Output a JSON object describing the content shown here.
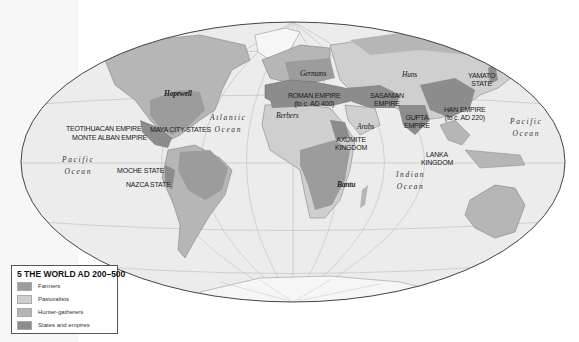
{
  "legend": {
    "title": "5 THE WORLD AD 200–500",
    "items": [
      {
        "label": "Farmers",
        "color": "#9c9c9c"
      },
      {
        "label": "Pastoralists",
        "color": "#cfcfcf"
      },
      {
        "label": "Hunter-gatherers",
        "color": "#b6b6b6"
      },
      {
        "label": "States and empires",
        "color": "#8c8c8c"
      }
    ]
  },
  "labels": {
    "hopewell": "Hopewell",
    "germans": "Germans",
    "huns": "Huns",
    "yamato": [
      "YAMATO",
      "STATE"
    ],
    "roman": [
      "ROMAN EMPIRE",
      "(to c. AD 400)"
    ],
    "sasanian": [
      "SASANIAN",
      "EMPIRE"
    ],
    "han": [
      "HAN EMPIRE",
      "(to c. AD 220)"
    ],
    "gupta": [
      "GUPTA",
      "EMPIRE"
    ],
    "berbers": "Berbers",
    "arabs": "Arabs",
    "axumite": [
      "AXUMITE",
      "KINGDOM"
    ],
    "lanka": [
      "LANKA",
      "KINGDOM"
    ],
    "bantu": "Bantu",
    "teotihuacan": "TEOTIHUACAN EMPIRE",
    "monte_alban": "MONTE ALBAN EMPIRE",
    "maya": "MAYA CITY-STATES",
    "moche": "MOCHE STATE",
    "nazca": "NAZCA STATE"
  },
  "oceans": {
    "atlantic": [
      "Atlantic",
      "Ocean"
    ],
    "pacific_east": [
      "Pacific",
      "Ocean"
    ],
    "pacific_west": [
      "Pacific",
      "Ocean"
    ],
    "indian": [
      "Indian",
      "Ocean"
    ]
  },
  "colors": {
    "ocean": "#ececec",
    "graticule": "#b9b9b9",
    "outline": "#444444",
    "ice": "#f6f6f6"
  }
}
